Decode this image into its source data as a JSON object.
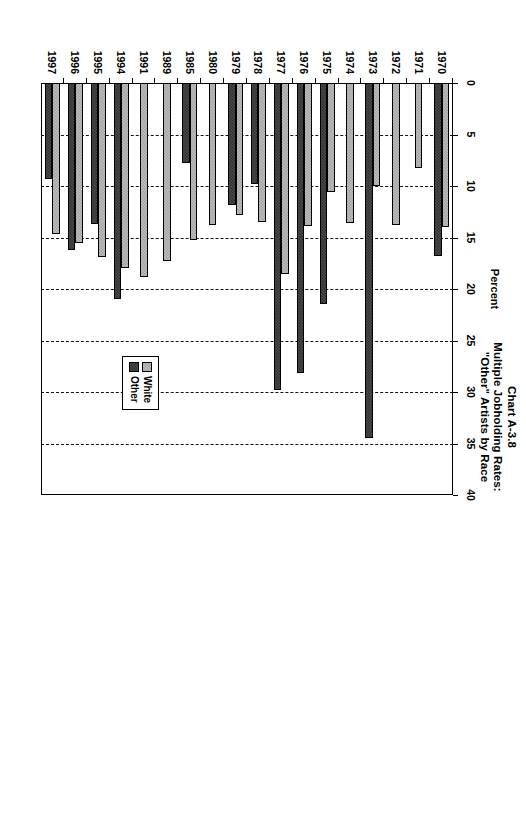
{
  "title": {
    "line1": "Chart A-3.8",
    "line2": "Multiple Jobholding Rates:",
    "line3": "\"Other\" Artists by Race"
  },
  "legend": {
    "position": "bottom-right-inside",
    "entries": [
      {
        "label": "White",
        "swatch": "white-series",
        "color": "#bdbdbd"
      },
      {
        "label": "Other",
        "swatch": "other-series",
        "color": "#4a4a4a"
      }
    ]
  },
  "chart_data": {
    "type": "bar",
    "orientation": "horizontal",
    "title": "Chart A-3.8 Multiple Jobholding Rates: \"Other\" Artists by Race",
    "xlabel": "Percent",
    "ylabel": "",
    "xlim": [
      0,
      40
    ],
    "xticks": [
      0,
      5,
      10,
      15,
      20,
      25,
      30,
      35,
      40
    ],
    "xtick_labels": [
      "0",
      "5",
      "10",
      "15",
      "20",
      "25",
      "30",
      "35",
      "40"
    ],
    "grid": "vertical-dashed",
    "legend_position": "lower right",
    "categories": [
      "1970",
      "1971",
      "1972",
      "1973",
      "1974",
      "1975",
      "1976",
      "1977",
      "1978",
      "1979",
      "1980",
      "1985",
      "1989",
      "1991",
      "1994",
      "1995",
      "1996",
      "1997"
    ],
    "series": [
      {
        "name": "White",
        "color": "#bdbdbd",
        "values": [
          14.0,
          8.3,
          13.8,
          10.0,
          13.6,
          10.6,
          13.9,
          18.5,
          13.5,
          12.8,
          13.8,
          15.2,
          17.3,
          18.8,
          18.0,
          16.9,
          15.5,
          14.7
        ]
      },
      {
        "name": "Other",
        "color": "#4a4a4a",
        "values": [
          16.8,
          null,
          null,
          34.5,
          null,
          21.5,
          28.2,
          29.8,
          9.8,
          11.8,
          null,
          7.8,
          null,
          null,
          21.0,
          13.7,
          16.2,
          9.3
        ]
      }
    ]
  }
}
